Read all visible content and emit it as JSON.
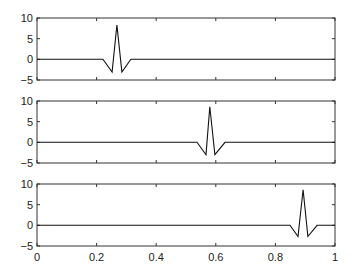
{
  "chart_data": [
    {
      "type": "line",
      "title": "",
      "xlabel": "",
      "ylabel": "",
      "xlim": [
        0,
        1
      ],
      "ylim": [
        -5,
        10
      ],
      "xticks": [],
      "yticks": [
        -5,
        0,
        5,
        10
      ],
      "grid": false,
      "series": [
        {
          "name": "signal 1",
          "x": [
            0,
            0.221,
            0.252,
            0.268,
            0.285,
            0.315,
            1
          ],
          "y": [
            0,
            0,
            -3.1,
            8.3,
            -3.1,
            0,
            0
          ]
        }
      ]
    },
    {
      "type": "line",
      "title": "",
      "xlabel": "",
      "ylabel": "",
      "xlim": [
        0,
        1
      ],
      "ylim": [
        -5,
        10
      ],
      "xticks": [],
      "yticks": [
        -5,
        0,
        5,
        10
      ],
      "grid": false,
      "series": [
        {
          "name": "signal 2",
          "x": [
            0,
            0.537,
            0.567,
            0.58,
            0.597,
            0.631,
            1
          ],
          "y": [
            0,
            0,
            -3.0,
            8.6,
            -3.0,
            0,
            0
          ]
        }
      ]
    },
    {
      "type": "line",
      "title": "",
      "xlabel": "",
      "ylabel": "",
      "xlim": [
        0,
        1
      ],
      "ylim": [
        -5,
        10
      ],
      "xticks": [
        0,
        0.2,
        0.4,
        0.6,
        0.8,
        1
      ],
      "xticklabels": [
        "0",
        "0.2",
        "0.4",
        "0.6",
        "0.8",
        "1"
      ],
      "yticks": [
        -5,
        0,
        5,
        10
      ],
      "grid": false,
      "series": [
        {
          "name": "signal 3",
          "x": [
            0,
            0.849,
            0.876,
            0.893,
            0.909,
            0.94,
            1
          ],
          "y": [
            0,
            0,
            -2.7,
            8.6,
            -2.7,
            0,
            0
          ]
        }
      ]
    }
  ],
  "style": {
    "line_color": "#111111",
    "axes_color": "#333333"
  },
  "labels": {
    "ytick_10": "10",
    "ytick_5": "5",
    "ytick_0": "0",
    "ytick_m5": "−5",
    "xtick_0": "0",
    "xtick_02": "0.2",
    "xtick_04": "0.4",
    "xtick_06": "0.6",
    "xtick_08": "0.8",
    "xtick_1": "1"
  }
}
